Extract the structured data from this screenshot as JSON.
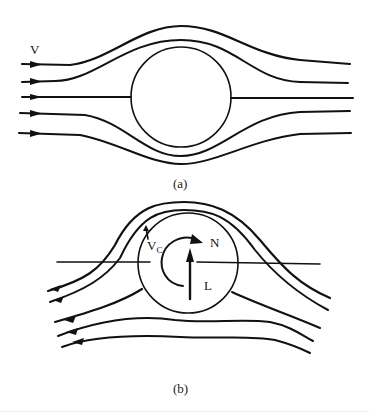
{
  "figure": {
    "panel_a": {
      "caption": "(a)",
      "velocity_label": "V",
      "description": "Uniform flow past a non-rotating cylinder; symmetric streamlines"
    },
    "panel_b": {
      "caption": "(b)",
      "circulation_velocity_label": "V",
      "circulation_velocity_subscript": "C",
      "rotation_label": "N",
      "lift_label": "L",
      "description": "Flow past a rotating cylinder (Magnus effect); streamlines crowd above producing lift L"
    },
    "colors": {
      "ink": "#111111",
      "background": "#ffffff"
    }
  }
}
